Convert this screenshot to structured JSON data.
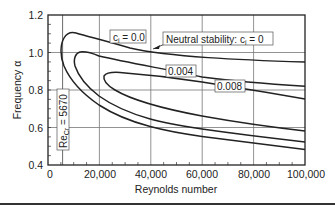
{
  "chart_data": {
    "type": "line",
    "title": "",
    "xlabel": "Reynolds number",
    "ylabel": "Frequency α",
    "xlim": [
      0,
      100000
    ],
    "ylim": [
      0.4,
      1.2
    ],
    "grid": true,
    "x_ticks": [
      "0",
      "20,000",
      "40,000",
      "60,000",
      "80,000",
      "100,000"
    ],
    "y_ticks": [
      "0.4",
      "0.6",
      "0.8",
      "1.0",
      "1.2"
    ],
    "series": [
      {
        "name": "c_i = 0.0",
        "label": "c",
        "label_sub": "i",
        "label_rest": " = 0.0",
        "points": [
          [
            100000,
            0.487
          ],
          [
            80000,
            0.52
          ],
          [
            60000,
            0.56
          ],
          [
            40000,
            0.62
          ],
          [
            20000,
            0.74
          ],
          [
            10000,
            0.87
          ],
          [
            6500,
            0.95
          ],
          [
            5670,
            1.02
          ],
          [
            6000,
            1.07
          ],
          [
            7800,
            1.1
          ],
          [
            12000,
            1.085
          ],
          [
            20000,
            1.05
          ],
          [
            40000,
            1.0
          ],
          [
            60000,
            0.975
          ],
          [
            80000,
            0.96
          ],
          [
            100000,
            0.95
          ]
        ]
      },
      {
        "name": "c_i = 0.004",
        "label": "0.004",
        "points": [
          [
            100000,
            0.527
          ],
          [
            80000,
            0.56
          ],
          [
            60000,
            0.6
          ],
          [
            40000,
            0.66
          ],
          [
            20000,
            0.79
          ],
          [
            12000,
            0.89
          ],
          [
            10000,
            0.95
          ],
          [
            10500,
            0.99
          ],
          [
            13000,
            1.0
          ],
          [
            20000,
            0.975
          ],
          [
            40000,
            0.925
          ],
          [
            60000,
            0.88
          ],
          [
            80000,
            0.85
          ],
          [
            100000,
            0.82
          ]
        ]
      },
      {
        "name": "c_i = 0.008",
        "label": "0.008",
        "points": [
          [
            100000,
            0.585
          ],
          [
            80000,
            0.615
          ],
          [
            60000,
            0.65
          ],
          [
            40000,
            0.72
          ],
          [
            25000,
            0.8
          ],
          [
            20000,
            0.86
          ],
          [
            21000,
            0.88
          ],
          [
            25000,
            0.885
          ],
          [
            40000,
            0.86
          ],
          [
            60000,
            0.82
          ],
          [
            80000,
            0.785
          ],
          [
            100000,
            0.75
          ]
        ]
      }
    ],
    "annotations": [
      {
        "text": "Neutral stability: c",
        "sub": "i",
        "rest": " = 0",
        "arrow_to": [
          16500,
          0.985
        ]
      },
      {
        "text": "Re",
        "sub": "Cr",
        "rest": " = 5670",
        "vertical_line_at": 5670
      }
    ]
  }
}
